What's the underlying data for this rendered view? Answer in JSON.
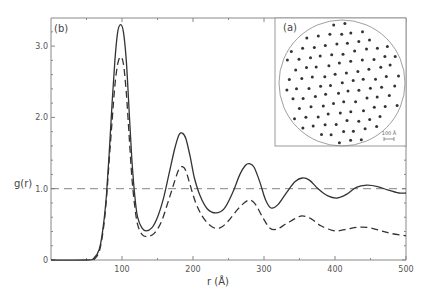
{
  "chart_data": {
    "type": "line",
    "title": "",
    "xlabel": "r (Å)",
    "ylabel": "g(r)",
    "xlim": [
      0,
      500
    ],
    "ylim": [
      0,
      3.4
    ],
    "grid": false,
    "legend": null,
    "panel_labels": {
      "main": "(b)",
      "inset": "(a)"
    },
    "xticks": [
      {
        "value": 100,
        "label": "100"
      },
      {
        "value": 200,
        "label": "200"
      },
      {
        "value": 300,
        "label": "300"
      },
      {
        "value": 400,
        "label": "400"
      },
      {
        "value": 500,
        "label": "500"
      }
    ],
    "xminor": [
      50,
      150,
      250,
      350,
      450
    ],
    "yticks": [
      {
        "value": 0,
        "label": "0"
      },
      {
        "value": 1.0,
        "label": "1.0"
      },
      {
        "value": 2.0,
        "label": "2.0"
      },
      {
        "value": 3.0,
        "label": "3.0"
      }
    ],
    "yminor": [
      0.2,
      0.4,
      0.6,
      0.8,
      1.2,
      1.4,
      1.6,
      1.8,
      2.2,
      2.4,
      2.6,
      2.8,
      3.2
    ],
    "reference_line": {
      "y": 1.0,
      "style": "dashed"
    },
    "series": [
      {
        "name": "solid",
        "style": "solid",
        "points": [
          [
            0,
            0
          ],
          [
            50,
            0
          ],
          [
            60,
            0.02
          ],
          [
            68,
            0.15
          ],
          [
            74,
            0.5
          ],
          [
            78,
            0.9
          ],
          [
            82,
            1.5
          ],
          [
            86,
            2.2
          ],
          [
            90,
            2.8
          ],
          [
            94,
            3.2
          ],
          [
            98,
            3.3
          ],
          [
            102,
            3.2
          ],
          [
            106,
            2.8
          ],
          [
            110,
            2.1
          ],
          [
            114,
            1.4
          ],
          [
            118,
            0.9
          ],
          [
            122,
            0.6
          ],
          [
            128,
            0.45
          ],
          [
            134,
            0.41
          ],
          [
            142,
            0.45
          ],
          [
            150,
            0.6
          ],
          [
            158,
            0.85
          ],
          [
            166,
            1.2
          ],
          [
            174,
            1.55
          ],
          [
            180,
            1.75
          ],
          [
            185,
            1.78
          ],
          [
            190,
            1.7
          ],
          [
            196,
            1.45
          ],
          [
            202,
            1.15
          ],
          [
            210,
            0.9
          ],
          [
            220,
            0.72
          ],
          [
            232,
            0.66
          ],
          [
            244,
            0.72
          ],
          [
            256,
            0.95
          ],
          [
            266,
            1.2
          ],
          [
            274,
            1.33
          ],
          [
            280,
            1.35
          ],
          [
            286,
            1.3
          ],
          [
            294,
            1.1
          ],
          [
            302,
            0.85
          ],
          [
            310,
            0.73
          ],
          [
            320,
            0.78
          ],
          [
            332,
            0.95
          ],
          [
            344,
            1.1
          ],
          [
            354,
            1.15
          ],
          [
            364,
            1.12
          ],
          [
            376,
            1.0
          ],
          [
            390,
            0.9
          ],
          [
            403,
            0.87
          ],
          [
            416,
            0.92
          ],
          [
            430,
            1.02
          ],
          [
            445,
            1.05
          ],
          [
            460,
            1.03
          ],
          [
            475,
            0.98
          ],
          [
            490,
            0.94
          ],
          [
            500,
            0.94
          ]
        ]
      },
      {
        "name": "dashed",
        "style": "dashed",
        "points": [
          [
            60,
            0
          ],
          [
            68,
            0.12
          ],
          [
            74,
            0.45
          ],
          [
            78,
            0.85
          ],
          [
            82,
            1.4
          ],
          [
            86,
            1.95
          ],
          [
            90,
            2.45
          ],
          [
            94,
            2.75
          ],
          [
            98,
            2.85
          ],
          [
            102,
            2.75
          ],
          [
            106,
            2.35
          ],
          [
            110,
            1.75
          ],
          [
            114,
            1.15
          ],
          [
            118,
            0.75
          ],
          [
            122,
            0.5
          ],
          [
            128,
            0.36
          ],
          [
            136,
            0.33
          ],
          [
            146,
            0.38
          ],
          [
            156,
            0.55
          ],
          [
            166,
            0.85
          ],
          [
            174,
            1.1
          ],
          [
            180,
            1.27
          ],
          [
            185,
            1.31
          ],
          [
            190,
            1.25
          ],
          [
            196,
            1.05
          ],
          [
            204,
            0.8
          ],
          [
            214,
            0.6
          ],
          [
            226,
            0.47
          ],
          [
            238,
            0.45
          ],
          [
            250,
            0.55
          ],
          [
            262,
            0.7
          ],
          [
            272,
            0.8
          ],
          [
            280,
            0.84
          ],
          [
            288,
            0.78
          ],
          [
            298,
            0.6
          ],
          [
            308,
            0.45
          ],
          [
            318,
            0.43
          ],
          [
            330,
            0.5
          ],
          [
            344,
            0.58
          ],
          [
            354,
            0.62
          ],
          [
            366,
            0.58
          ],
          [
            380,
            0.48
          ],
          [
            395,
            0.42
          ],
          [
            405,
            0.41
          ],
          [
            420,
            0.44
          ],
          [
            435,
            0.46
          ],
          [
            450,
            0.45
          ],
          [
            465,
            0.41
          ],
          [
            480,
            0.37
          ],
          [
            500,
            0.34
          ]
        ]
      }
    ],
    "inset": {
      "type": "scatter",
      "description": "particle positions in circular domain",
      "scale_bar_label": "100 Å",
      "lattice": {
        "spacing": 11.3,
        "angle_deg": -8,
        "jitter": 1.2
      }
    }
  },
  "layout": {
    "plot": {
      "left": 51,
      "right": 406,
      "top": 18,
      "bottom": 260
    },
    "inset_box": {
      "left": 275,
      "top": 18,
      "right": 406,
      "bottom": 146
    },
    "inset_circle": {
      "cx": 342,
      "cy": 83,
      "r": 63
    }
  },
  "colors": {
    "line": "#333333",
    "axis": "#888888",
    "inset_border": "#999999",
    "dot": "#333333"
  }
}
